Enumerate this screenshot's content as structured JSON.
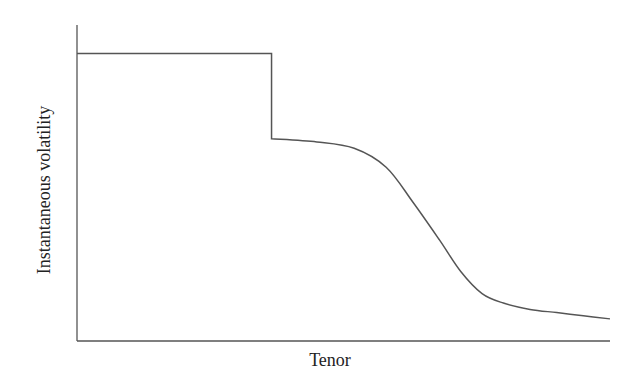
{
  "chart_data": {
    "type": "line",
    "title": "",
    "xlabel": "Tenor",
    "ylabel": "Instantaneous volatility",
    "grid": false,
    "legend": null,
    "ticks": {
      "x": [],
      "y": []
    },
    "note": "Qualitative schematic: no tick labels. Values are in normalized units (x: 0-1 of tenor axis, y: 0-1 of volatility axis).",
    "xlim": [
      0,
      1
    ],
    "ylim": [
      0,
      1
    ],
    "series": [
      {
        "name": "Instantaneous volatility",
        "x": [
          0.0,
          0.365,
          0.365,
          0.45,
          0.52,
          0.58,
          0.63,
          0.68,
          0.72,
          0.76,
          0.8,
          0.85,
          0.9,
          0.95,
          1.0
        ],
        "y": [
          0.91,
          0.91,
          0.64,
          0.63,
          0.61,
          0.55,
          0.44,
          0.32,
          0.22,
          0.15,
          0.12,
          0.1,
          0.09,
          0.08,
          0.07
        ]
      }
    ],
    "colors": {
      "line": "#555555",
      "axis": "#555555",
      "text": "#222222"
    }
  }
}
